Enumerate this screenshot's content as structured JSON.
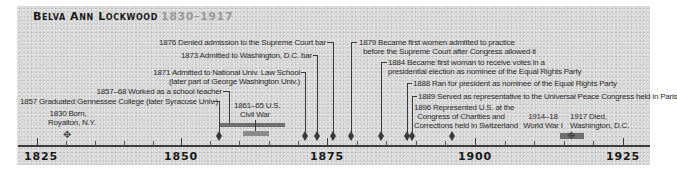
{
  "title": {
    "name": "Belva Ann Lockwood",
    "years": "1830–1917"
  },
  "axis": {
    "start_year": 1825,
    "end_year": 1925,
    "major_ticks": [
      "1825",
      "1850",
      "1875",
      "1900",
      "1925"
    ]
  },
  "events": [
    {
      "id": "born",
      "year": "1830",
      "text_1": "1830 Born,",
      "text_2": "Royalton, N.Y."
    },
    {
      "id": "genesee",
      "year": "1857",
      "text_1": "1857 Graduated Gennessee College (later Syracuse Univ.)"
    },
    {
      "id": "teacher",
      "year": "1857–68",
      "text_1": "1857–68 Worked as a school teacher"
    },
    {
      "id": "civilwar",
      "year": "1861–65",
      "text_1": "1861–65 U.S.",
      "text_2": "Civil War"
    },
    {
      "id": "lawschool",
      "year": "1871",
      "text_1": "1871 Admitted to National Univ. Law School",
      "text_2": "(later part of George Washington Univ.)"
    },
    {
      "id": "dcbar",
      "year": "1873",
      "text_1": "1873 Admitted to Washington, D.C. bar"
    },
    {
      "id": "denied",
      "year": "1876",
      "text_1": "1876 Denied admission to the Supreme Court bar"
    },
    {
      "id": "supreme",
      "year": "1879",
      "text_1": "1879 Became first women admitted to practice",
      "text_2": "before the Supreme Court after Congress allowed it"
    },
    {
      "id": "votes",
      "year": "1884",
      "text_1": "1884 Became first woman to receive votes in a",
      "text_2": "presidential election as nominee of the Equal Rights Party"
    },
    {
      "id": "ran",
      "year": "1888",
      "text_1": "1888 Ran for president as nominee of the Equal Rights Party"
    },
    {
      "id": "peace",
      "year": "1889",
      "text_1": "1889 Served as representative to the Universal Peace Congress held in Paris"
    },
    {
      "id": "swiss",
      "year": "1896",
      "text_1": "1896 Represented U.S. at the",
      "text_2": "Congress of Charities and",
      "text_3": "Corrections held in Switzerland"
    },
    {
      "id": "ww1",
      "year": "1914–18",
      "text_1": "1914–18",
      "text_2": "World War I"
    },
    {
      "id": "died",
      "year": "1917",
      "text_1": "1917 Died,",
      "text_2": "Washington, D.C."
    }
  ],
  "colors": {
    "panel": "#d6d6d6",
    "ink": "#3a3a3a",
    "bar": "#6e6e6e",
    "title_years": "#9a9a9a"
  }
}
